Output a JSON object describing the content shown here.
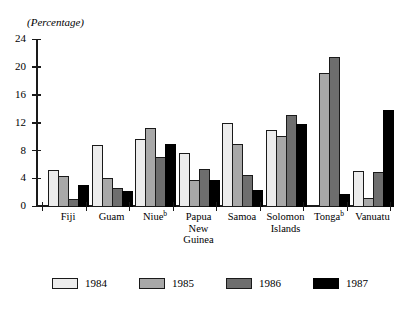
{
  "chart_data": {
    "type": "bar",
    "title": "",
    "subtitle": "",
    "unit_caption": "(Percentage)",
    "xlabel": "",
    "ylabel": "",
    "ylim": [
      0,
      24
    ],
    "yticks": [
      0,
      4,
      8,
      12,
      16,
      20,
      24
    ],
    "ytick_labels": [
      "0",
      "4",
      "8",
      "12",
      "16",
      "20",
      "24"
    ],
    "grid": false,
    "legend_position": "bottom",
    "categories": [
      "Fiji",
      "Guam",
      "Niue",
      "Papua New Guinea",
      "Samoa",
      "Solomon Islands",
      "Tonga",
      "Vanuatu"
    ],
    "category_label_lines": [
      [
        "Fiji"
      ],
      [
        "Guam"
      ],
      [
        "Niue"
      ],
      [
        "Papua",
        "New",
        "Guinea"
      ],
      [
        "Samoa"
      ],
      [
        "Solomon",
        "Islands"
      ],
      [
        "Tonga"
      ],
      [
        "Vanuatu"
      ]
    ],
    "category_footnotes": {
      "Niue": "b",
      "Tonga": "b"
    },
    "series": [
      {
        "name": "1984",
        "color": "#ececec",
        "values": [
          5.3,
          8.9,
          9.8,
          7.8,
          12.1,
          11.1,
          0.2,
          5.2
        ]
      },
      {
        "name": "1985",
        "color": "#a8a8a8",
        "values": [
          4.4,
          4.1,
          11.4,
          3.9,
          9.1,
          10.2,
          19.3,
          1.3
        ]
      },
      {
        "name": "1986",
        "color": "#6e6e6e",
        "values": [
          1.2,
          2.8,
          7.2,
          5.5,
          4.6,
          13.2,
          21.5,
          5.0
        ]
      },
      {
        "name": "1987",
        "color": "#000000",
        "values": [
          3.2,
          2.3,
          9.1,
          3.9,
          2.4,
          12.0,
          1.9,
          14.0
        ]
      }
    ]
  },
  "legend": {
    "items": [
      {
        "label": "1984",
        "color": "#ececec"
      },
      {
        "label": "1985",
        "color": "#a8a8a8"
      },
      {
        "label": "1986",
        "color": "#6e6e6e"
      },
      {
        "label": "1987",
        "color": "#000000"
      }
    ]
  }
}
